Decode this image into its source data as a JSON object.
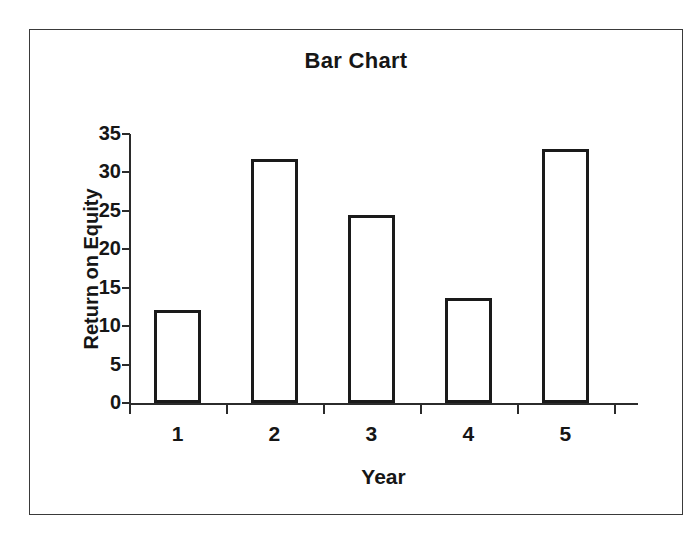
{
  "chart_data": {
    "type": "bar",
    "title": "Bar Chart",
    "xlabel": "Year",
    "ylabel": "Return on Equity",
    "categories": [
      "1",
      "2",
      "3",
      "4",
      "5"
    ],
    "values": [
      12.1,
      31.8,
      24.5,
      13.7,
      33.1
    ],
    "ylim": [
      0,
      35
    ],
    "ytick_labels": [
      "0",
      "5",
      "10",
      "15",
      "20",
      "25",
      "30",
      "35"
    ],
    "ytick_values": [
      0,
      5,
      10,
      15,
      20,
      25,
      30,
      35
    ],
    "grid": false,
    "legend": false,
    "bar_fill_color": "#ffffff",
    "bar_border_color": "#1a1a1a",
    "axis_color": "#2b2b2b",
    "background_color": "#ffffff",
    "frame_border_color": "#3a3a3a"
  }
}
